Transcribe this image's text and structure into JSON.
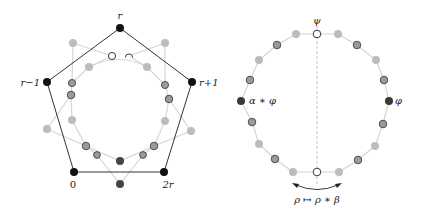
{
  "colors": {
    "background": "#ffffff",
    "pentagon_edge": "#333333",
    "black_node": "#111111",
    "dark_node": "#444444",
    "medium_node": "#9a9a9a",
    "medium_node_stroke": "#333333",
    "light_node": "#bdbdbd",
    "light_edge": "#d4d4d4",
    "open_node_fill": "#ffffff",
    "open_node_stroke": "#222222",
    "dashed_axis": "#b0b0b0"
  },
  "left_diagram": {
    "pentagon_vertices": [
      {
        "id": "r",
        "label": "r",
        "x": 120,
        "y": 28
      },
      {
        "id": "r+1",
        "label": "r+1",
        "x": 192,
        "y": 82
      },
      {
        "id": "2r",
        "label": "2r",
        "x": 164,
        "y": 172
      },
      {
        "id": "0",
        "label": "0",
        "x": 74,
        "y": 172
      },
      {
        "id": "r-1",
        "label": "r−1",
        "x": 47,
        "y": 82
      }
    ],
    "labels": {
      "r": "r",
      "r_plus_1": "r+1",
      "two_r": "2r",
      "zero": "0",
      "r_minus_1": "r−1"
    }
  },
  "right_diagram": {
    "labels": {
      "psi": "ψ",
      "phi": "φ",
      "alpha_phi": "α ∗ φ",
      "map": "ρ ↦ ρ ∗ β"
    }
  }
}
